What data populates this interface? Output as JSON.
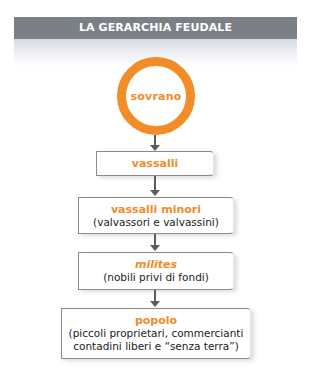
{
  "title": "LA GERARCHIA FEUDALE",
  "colors": {
    "accent": "#f28c28",
    "header_bg": "#7b8087",
    "arrow": "#5c5c5c",
    "text": "#222222"
  },
  "hierarchy": {
    "top": {
      "label": "sovrano",
      "shape": "circle"
    },
    "levels": [
      {
        "title": "vassalli",
        "subtitle_lines": []
      },
      {
        "title": "vassalli minori",
        "subtitle_lines": [
          "(valvassori e valvassini)"
        ]
      },
      {
        "title": "milites",
        "title_style": "italic",
        "subtitle_lines": [
          "(nobili privi di fondi)"
        ]
      },
      {
        "title": "popolo",
        "subtitle_lines": [
          "(piccoli proprietari, commercianti",
          "contadini liberi e “senza terra”)"
        ]
      }
    ]
  }
}
